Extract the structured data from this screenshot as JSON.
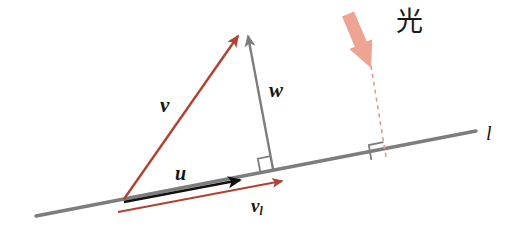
{
  "figure": {
    "width": 518,
    "height": 232,
    "background": "#ffffff"
  },
  "colors": {
    "red": "#B14231",
    "gray": "#7D7D7D",
    "black": "#111111",
    "salmon": "#EDA492",
    "dashed": "#E09C8B",
    "text": "#151515"
  },
  "labels": {
    "v": "v",
    "w": "w",
    "u": "u",
    "v_sub_base": "v",
    "v_sub_script": "l",
    "line": "l",
    "light": "光"
  },
  "icons": {
    "light_arrow": "thick-down-arrow-icon",
    "projection_dashed": "dashed-projection-line-icon",
    "right_angle_w": "right-angle-marker-icon",
    "right_angle_light": "right-angle-marker-icon"
  },
  "geometry": {
    "line_l": {
      "x1": 36,
      "y1": 216,
      "x2": 476,
      "y2": 131,
      "stroke": "#7D7D7D",
      "width": 3.4
    },
    "origin": {
      "x": 124,
      "y": 199
    },
    "apex": {
      "x": 241,
      "y": 33
    },
    "foot_w": {
      "x": 273,
      "y": 169
    },
    "vector_v": {
      "x1": 124,
      "y1": 199,
      "x2": 238,
      "y2": 36,
      "stroke": "#B14231",
      "width": 2.4
    },
    "vector_w": {
      "x1": 273,
      "y1": 169,
      "x2": 248,
      "y2": 36,
      "stroke": "#7D7D7D",
      "width": 2.4
    },
    "vector_u": {
      "x1": 124,
      "y1": 202,
      "x2": 240,
      "y2": 180,
      "stroke": "#111111",
      "width": 2.6
    },
    "vector_vl": {
      "x1": 118,
      "y1": 212,
      "x2": 282,
      "y2": 181,
      "stroke": "#B14231",
      "width": 2.2
    },
    "light_arrow": {
      "x1": 348,
      "y1": 14,
      "x2": 371,
      "y2": 68,
      "fill": "#EDA492",
      "shaft_width": 13
    },
    "dashed_ray": {
      "x1": 371,
      "y1": 66,
      "x2": 386,
      "y2": 157,
      "stroke": "#E09C8B",
      "width": 1.6,
      "dash": "4 4"
    },
    "right_angle_w": {
      "cx": 273,
      "cy": 169,
      "size": 13
    },
    "right_angle_light": {
      "cx": 386,
      "cy": 157,
      "size": 15
    }
  }
}
